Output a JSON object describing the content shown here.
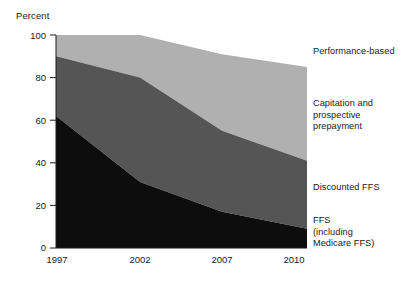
{
  "chart_data": {
    "type": "area",
    "title": "",
    "subtitle": "",
    "xlabel": "",
    "ylabel": "Percent",
    "x": [
      1997,
      2002,
      2007,
      2010
    ],
    "xtick_labels": [
      "1997",
      "2002",
      "2007",
      "2010"
    ],
    "ytick_labels": [
      "0",
      "20",
      "40",
      "60",
      "80",
      "100"
    ],
    "yticks": [
      0,
      20,
      40,
      60,
      80,
      100
    ],
    "ylim": [
      0,
      100
    ],
    "xlim": [
      1997,
      2010
    ],
    "grid": false,
    "legend_position": "right-inline-labels",
    "stacked": true,
    "series": [
      {
        "name": "FFS (including Medicare FFS)",
        "label": "FFS\n(including\nMedicare FFS)",
        "color": "#0d0d0d",
        "values": [
          38,
          15,
          8,
          5
        ]
      },
      {
        "name": "Discounted FFS",
        "label": "Discounted FFS",
        "color": "#0d0d0d",
        "values": [
          24,
          16,
          9,
          4
        ]
      },
      {
        "name": "Capitation and prospective prepayment",
        "label": "Capitation and\nprospective\nprepayment",
        "color": "#555555",
        "values": [
          28,
          49,
          38,
          32
        ]
      },
      {
        "name": "Performance-based",
        "label": "Performance-based",
        "color": "#b0b0b0",
        "values": [
          10,
          20,
          36,
          44
        ]
      }
    ],
    "boundaries": {
      "comment_ffs_top": [
        62,
        31,
        17,
        9
      ],
      "comment_capitation_top": [
        90,
        80,
        55,
        41
      ],
      "comment_performance_top": [
        100,
        100,
        91,
        85
      ]
    },
    "colors": {
      "performance_based": "#b0b0b0",
      "capitation": "#555555",
      "ffs_black": "#0d0d0d",
      "axis": "#1a1a1a",
      "background": "#ffffff"
    }
  },
  "axes": {
    "y_title": "Percent",
    "y_ticks": [
      {
        "label": "100",
        "value": 100
      },
      {
        "label": "80",
        "value": 80
      },
      {
        "label": "60",
        "value": 60
      },
      {
        "label": "40",
        "value": 40
      },
      {
        "label": "20",
        "value": 20
      },
      {
        "label": "0",
        "value": 0
      }
    ],
    "x_ticks": [
      {
        "label": "1997",
        "value": 1997
      },
      {
        "label": "2002",
        "value": 2002
      },
      {
        "label": "2007",
        "value": 2007
      },
      {
        "label": "2010",
        "value": 2010
      }
    ]
  },
  "legend": {
    "items": [
      {
        "name": "performance-based",
        "label": "Performance-based"
      },
      {
        "name": "capitation",
        "label": "Capitation and\nprospective\nprepayment"
      },
      {
        "name": "discounted-ffs",
        "label": "Discounted FFS"
      },
      {
        "name": "ffs",
        "label": "FFS\n(including\nMedicare FFS)"
      }
    ]
  }
}
